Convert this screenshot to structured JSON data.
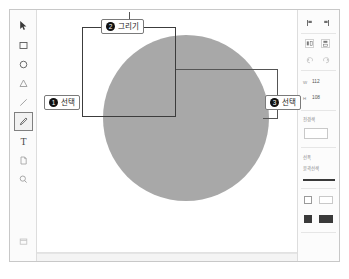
{
  "window": {
    "title": "Drawing Editor"
  },
  "toolbar": {
    "tools": [
      {
        "name": "pointer-tool",
        "icon": "cursor-arrow-icon",
        "glyph": "",
        "selected": false
      },
      {
        "name": "rectangle-tool",
        "icon": "square-icon",
        "glyph": "",
        "selected": false
      },
      {
        "name": "ellipse-tool",
        "icon": "circle-icon",
        "glyph": "",
        "selected": false
      },
      {
        "name": "triangle-tool",
        "icon": "triangle-icon",
        "glyph": "",
        "selected": false
      },
      {
        "name": "line-tool",
        "icon": "line-icon",
        "glyph": "",
        "selected": false
      },
      {
        "name": "pen-tool",
        "icon": "pen-icon",
        "glyph": "",
        "selected": true
      },
      {
        "name": "text-tool",
        "icon": "text-t-icon",
        "glyph": "T",
        "selected": false
      },
      {
        "name": "page-tool",
        "icon": "page-icon",
        "glyph": "",
        "selected": false
      },
      {
        "name": "zoom-tool",
        "icon": "magnifier-icon",
        "glyph": "",
        "selected": false
      }
    ]
  },
  "callouts": [
    {
      "number": "1",
      "label": "선택",
      "name": "callout-select-tool"
    },
    {
      "number": "2",
      "label": "그리기",
      "name": "callout-draw"
    },
    {
      "number": "3",
      "label": "선택",
      "name": "callout-select-shape"
    }
  ],
  "canvas": {
    "shapes": [
      {
        "name": "circle-shape",
        "type": "circle",
        "fill": "#a8a8a8",
        "stroke": "none"
      },
      {
        "name": "rectangle-shape",
        "type": "rectangle",
        "fill": "none",
        "stroke": "#3c3c3c"
      }
    ]
  },
  "properties": {
    "align_label": "",
    "align_buttons": [
      {
        "name": "align-left-button",
        "icon": "align-left-icon"
      },
      {
        "name": "align-right-button",
        "icon": "align-right-icon"
      }
    ],
    "transform_buttons": [
      {
        "name": "flip-horizontal-button",
        "icon": "flip-horizontal-icon"
      },
      {
        "name": "flip-vertical-button",
        "icon": "flip-vertical-icon"
      }
    ],
    "rotate_buttons": [
      {
        "name": "rotate-left-button",
        "icon": "rotate-left-icon"
      },
      {
        "name": "rotate-right-button",
        "icon": "rotate-right-icon"
      }
    ],
    "size": {
      "width_label": "W",
      "width_value": "112",
      "height_label": "H",
      "height_value": "108"
    },
    "fill_section": {
      "label": "전경색",
      "swatch_color": "#ffffff"
    },
    "stroke_section": {
      "label": "선폭",
      "sub_label": "윤곽선색",
      "preview_color": "#3a3a3a"
    },
    "options": [
      {
        "name": "outline-option",
        "label": "",
        "checked": false,
        "swatch": "#ffffff"
      },
      {
        "name": "fill-option",
        "label": "",
        "checked": true,
        "swatch": "#3a3a3a"
      }
    ]
  },
  "colors": {
    "shape_gray": "#a8a8a8",
    "outline": "#3c3c3c",
    "callout_border": "#7a7a7a",
    "bullet": "#111111"
  }
}
